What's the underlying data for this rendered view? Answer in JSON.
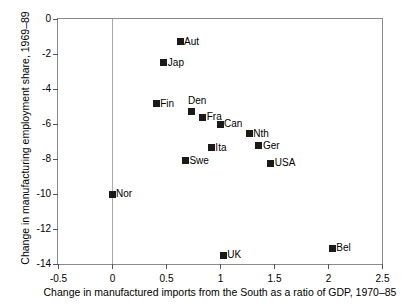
{
  "chart_data": {
    "type": "scatter",
    "title": "",
    "xlabel": "Change in manufactured imports from the South as a ratio of GDP, 1970–85",
    "ylabel": "Change in manufacturing employment share, 1969–89",
    "xlim": [
      -0.5,
      2.5
    ],
    "ylim": [
      -14,
      0
    ],
    "grid": false,
    "legend": "none",
    "reference_line_x": 0,
    "xticks": [
      "-0.5",
      "0",
      "0.5",
      "1",
      "1.5",
      "2",
      "2.5"
    ],
    "xtick_values": [
      -0.5,
      0,
      0.5,
      1,
      1.5,
      2,
      2.5
    ],
    "yticks": [
      "0",
      "-2",
      "-4",
      "-6",
      "-8",
      "-10",
      "-12",
      "-14"
    ],
    "ytick_values": [
      0,
      -2,
      -4,
      -6,
      -8,
      -10,
      -12,
      -14
    ],
    "marker_color": "#1a1a1a",
    "marker_shape": "square",
    "points": [
      {
        "label": "Aut",
        "x": 0.63,
        "y": -1.3,
        "label_pos": "right"
      },
      {
        "label": "Jap",
        "x": 0.48,
        "y": -2.5,
        "label_pos": "right"
      },
      {
        "label": "Fin",
        "x": 0.41,
        "y": -4.85,
        "label_pos": "right"
      },
      {
        "label": "Den",
        "x": 0.74,
        "y": -5.3,
        "label_pos": "above"
      },
      {
        "label": "Fra",
        "x": 0.84,
        "y": -5.6,
        "label_pos": "right"
      },
      {
        "label": "Can",
        "x": 1.0,
        "y": -6.0,
        "label_pos": "right"
      },
      {
        "label": "Nth",
        "x": 1.27,
        "y": -6.55,
        "label_pos": "right"
      },
      {
        "label": "Ger",
        "x": 1.36,
        "y": -7.25,
        "label_pos": "right"
      },
      {
        "label": "Ita",
        "x": 0.92,
        "y": -7.35,
        "label_pos": "right"
      },
      {
        "label": "Swe",
        "x": 0.68,
        "y": -8.1,
        "label_pos": "right"
      },
      {
        "label": "USA",
        "x": 1.47,
        "y": -8.25,
        "label_pos": "right"
      },
      {
        "label": "Nor",
        "x": 0.0,
        "y": -10.0,
        "label_pos": "right"
      },
      {
        "label": "Bel",
        "x": 2.04,
        "y": -13.1,
        "label_pos": "right"
      },
      {
        "label": "UK",
        "x": 1.03,
        "y": -13.5,
        "label_pos": "right"
      }
    ]
  }
}
